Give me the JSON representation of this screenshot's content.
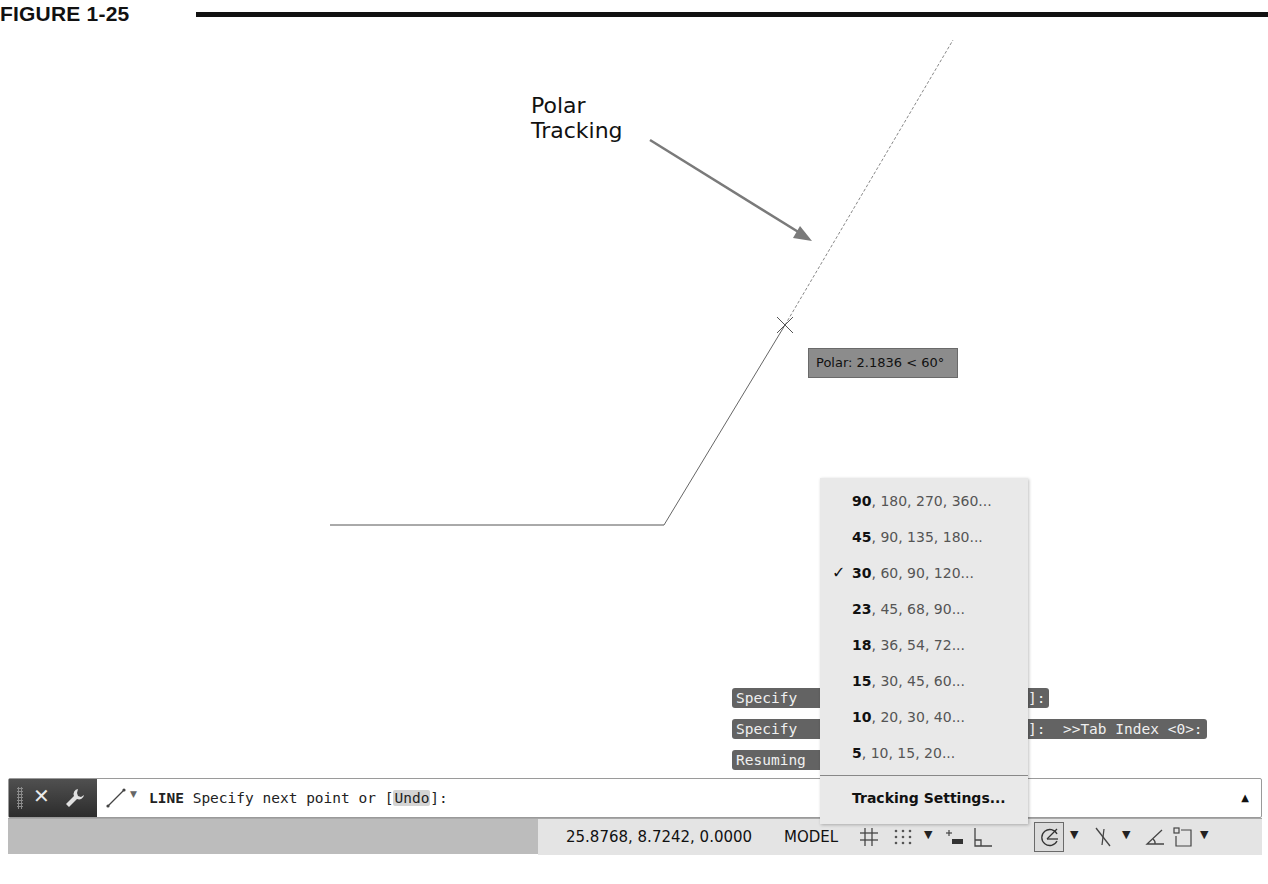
{
  "figure": {
    "label": "FIGURE 1-25"
  },
  "callout": {
    "line1": "Polar",
    "line2": "Tracking"
  },
  "tooltip": {
    "text": "Polar: 2.1836 < 60°"
  },
  "command_history": [
    {
      "left": "Specify",
      "right": "]:"
    },
    {
      "left": "Specify",
      "right": "]:  >>Tab Index <0>:"
    },
    {
      "left": "Resuming",
      "right": ""
    }
  ],
  "polar_menu": {
    "items": [
      {
        "lead": "90",
        "rest": ", 180, 270, 360...",
        "checked": false
      },
      {
        "lead": "45",
        "rest": ", 90, 135, 180...",
        "checked": false
      },
      {
        "lead": "30",
        "rest": ", 60, 90, 120...",
        "checked": true
      },
      {
        "lead": "23",
        "rest": ", 45, 68, 90...",
        "checked": false
      },
      {
        "lead": "18",
        "rest": ", 36, 54, 72...",
        "checked": false
      },
      {
        "lead": "15",
        "rest": ", 30, 45, 60...",
        "checked": false
      },
      {
        "lead": "10",
        "rest": ", 20, 30, 40...",
        "checked": false
      },
      {
        "lead": "5",
        "rest": ", 10, 15, 20...",
        "checked": false
      }
    ],
    "check_glyph": "✓",
    "settings_label": "Tracking Settings..."
  },
  "command_line": {
    "close_glyph": "✕",
    "command": "LINE",
    "prompt_before": " Specify next point or [",
    "option": "Undo",
    "prompt_after": "]:",
    "expand_glyph": "▲",
    "icons": [
      "grip-icon",
      "close-icon",
      "wrench-icon",
      "line-tool-icon",
      "dropdown-caret-icon"
    ]
  },
  "status_bar": {
    "coordinates": "25.8768, 8.7242, 0.0000",
    "space": "MODEL",
    "dropdown_glyph": "▼",
    "icons": [
      "grid-icon",
      "snap-icon",
      "infer-constraints-icon",
      "ortho-icon",
      "polar-tracking-icon",
      "object-snap-tracking-icon",
      "dynamic-ucs-icon",
      "selection-cycling-icon"
    ]
  },
  "colors": {
    "tooltip_bg": "#8c8c8c",
    "history_chip_bg": "#636363",
    "menu_bg": "#e9e9e9",
    "status_bar_bg": "#bcbcbc",
    "status_panel_bg": "#e4e4e4",
    "command_tools_bg": "#3a3a3a"
  }
}
